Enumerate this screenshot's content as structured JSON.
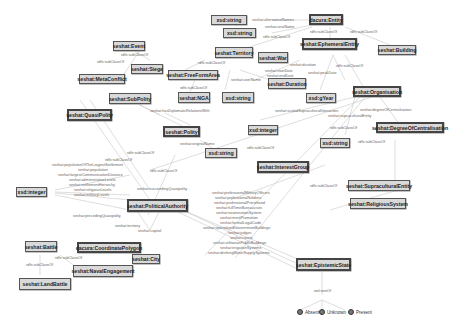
{
  "diagram": {
    "nodes": {
      "seshat_event": "seshat:Event",
      "seshat_siege": "seshat:Siege",
      "seshat_metaconflict": "seshat:MetaConflict",
      "seshat_subpolity": "seshat:SubPolity",
      "seshat_quasipolity": "seshat:QuasiPolity",
      "xsd_integer_left": "xsd:integer",
      "xsd_string_1": "xsd:string",
      "xsd_string_2": "xsd:string",
      "dacura_entity": "dacura:Entity",
      "seshat_territory": "seshat:Territory",
      "seshat_war": "seshat:War",
      "seshat_freeformarea": "seshat:FreeFormArea",
      "seshat_duration": "seshat:Duration",
      "seshat_nga": "seshat:NGA",
      "xsd_string_3": "xsd:string",
      "seshat_ephemeralentity": "seshat:EphemeralEntity",
      "seshat_building": "seshat:Building",
      "xsd_gyear": "xsd:gYear",
      "seshat_organisation": "seshat:Organisation",
      "seshat_polity": "seshat:Polity",
      "xsd_integer_mid": "xsd:integer",
      "xsd_string_4": "xsd:string",
      "xsd_string_5": "xsd:string",
      "seshat_degreeofcentralisation": "seshat:DegreeOfCentralisation",
      "seshat_interestgroup": "seshat:InterestGroup",
      "seshat_supraculturalentity": "seshat:SupraculturalEntity",
      "seshat_religioussystem": "seshat:ReligiousSystem",
      "seshat_politicalauthority": "seshat:PoliticalAuthority",
      "seshat_battle": "seshat:Battle",
      "dacura_coordinatepolygon": "dacura:CoordinatePolygon",
      "seshat_city": "seshat:City",
      "seshat_navalengagement": "seshat:NavalEngagement",
      "seshat_landbattle": "seshat:LandBattle",
      "seshat_epistemicstate": "seshat:EpistemicState"
    },
    "edge_labels": {
      "subclass": "rdfs:subClassOf",
      "alt_names": "seshat:alternativeNames",
      "unix_name": "seshat:unixName",
      "duration": "seshat:duration",
      "peak_date": "seshat:peakDate",
      "start_date": "seshat:startDate",
      "end_date": "seshat:endDate",
      "user_name": "seshat:userName",
      "diplomatic": "seshat:hasDiplomaticRelationsWith",
      "original_name": "seshat:originalName",
      "scaled_supra": "seshat:scaledSupraculturalInteraction",
      "supracultural_entity": "seshat:supraculturalEntity",
      "degree_central": "seshat:degreeOfCentralisation",
      "preceding": "seshat:precedingQuasipolity",
      "succeeding": "seshat:succeedingQuasipolity",
      "territory": "seshat:territory",
      "capital": "seshat:capital",
      "one_of": "owl:oneOf"
    },
    "integer_props": [
      "seshat:populationOfTheLargestSettlement",
      "seshat:population",
      "seshat:largestCommunicationDistance",
      "seshat:administrativeLevels",
      "seshat:settlementHierarchy",
      "seshat:religiousLevels",
      "seshat:militaryLevels"
    ],
    "epistemic_props": [
      "seshat:professionalMilitaryOfficers",
      "seshat:professionalSoldiers",
      "seshat:professionalPriesthood",
      "seshat:fullTimeBureaucrats",
      "seshat:examinationSystem",
      "seshat:meritPromotion",
      "seshat:formalLegalCode",
      "seshat:specializedGovernmentBuildings",
      "seshat:judges",
      "seshat:courts",
      "seshat:utilitarianPublicBuildings",
      "seshat:irrigationSystems",
      "seshat:drinkingWaterSupplySystems"
    ],
    "individuals": [
      "Absent",
      "Unknown",
      "Present"
    ]
  }
}
